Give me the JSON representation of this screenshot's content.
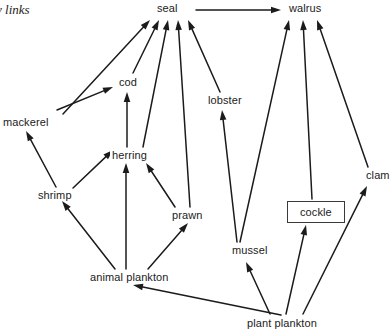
{
  "figure": {
    "caption": "y links",
    "width": 391,
    "height": 334,
    "background_color": "#ffffff",
    "line_color": "#1b1b1b",
    "text_color": "#1b1b1b"
  },
  "nodes": [
    {
      "id": "seal",
      "label": "seal",
      "x": 155,
      "y": 2,
      "boxed": false
    },
    {
      "id": "walrus",
      "label": "walrus",
      "x": 287,
      "y": 2,
      "boxed": false
    },
    {
      "id": "cod",
      "label": "cod",
      "x": 117,
      "y": 76,
      "boxed": false
    },
    {
      "id": "lobster",
      "label": "lobster",
      "x": 206,
      "y": 94,
      "boxed": false
    },
    {
      "id": "mackerel",
      "label": "mackerel",
      "x": 1,
      "y": 116,
      "boxed": false
    },
    {
      "id": "clam",
      "label": "clam",
      "x": 364,
      "y": 169,
      "boxed": false
    },
    {
      "id": "herring",
      "label": "herring",
      "x": 110,
      "y": 149,
      "boxed": false
    },
    {
      "id": "shrimp",
      "label": "shrimp",
      "x": 36,
      "y": 189,
      "boxed": false
    },
    {
      "id": "prawn",
      "label": "prawn",
      "x": 170,
      "y": 209,
      "boxed": false
    },
    {
      "id": "cockle",
      "label": "cockle",
      "x": 287,
      "y": 201,
      "boxed": true
    },
    {
      "id": "mussel",
      "label": "mussel",
      "x": 230,
      "y": 244,
      "boxed": false
    },
    {
      "id": "animal_plankton",
      "label": "animal plankton",
      "x": 88,
      "y": 271,
      "boxed": false
    },
    {
      "id": "plant_plankton",
      "label": "plant plankton",
      "x": 245,
      "y": 317,
      "boxed": false
    }
  ],
  "links": [
    {
      "id": "mackerel-to-seal",
      "from": "mackerel",
      "to": "seal",
      "x1": 63,
      "y1": 114,
      "x2": 150,
      "y2": 20
    },
    {
      "id": "cod-to-seal",
      "from": "cod",
      "to": "seal",
      "x1": 133,
      "y1": 73,
      "x2": 159,
      "y2": 20
    },
    {
      "id": "herring-to-seal",
      "from": "herring",
      "to": "seal",
      "x1": 143,
      "y1": 147,
      "x2": 168,
      "y2": 20
    },
    {
      "id": "prawn-to-seal",
      "from": "prawn",
      "to": "seal",
      "x1": 190,
      "y1": 207,
      "x2": 178,
      "y2": 20
    },
    {
      "id": "lobster-to-seal",
      "from": "lobster",
      "to": "seal",
      "x1": 220,
      "y1": 92,
      "x2": 188,
      "y2": 20
    },
    {
      "id": "seal-to-walrus",
      "from": "seal",
      "to": "walrus",
      "x1": 196,
      "y1": 10,
      "x2": 281,
      "y2": 10
    },
    {
      "id": "mussel-to-walrus",
      "from": "mussel",
      "to": "walrus",
      "x1": 240,
      "y1": 242,
      "x2": 289,
      "y2": 20
    },
    {
      "id": "cockle-to-walrus",
      "from": "cockle",
      "to": "walrus",
      "x1": 312,
      "y1": 199,
      "x2": 303,
      "y2": 20
    },
    {
      "id": "clam-to-walrus",
      "from": "clam",
      "to": "walrus",
      "x1": 368,
      "y1": 167,
      "x2": 317,
      "y2": 20
    },
    {
      "id": "mackerel-to-cod",
      "from": "mackerel",
      "to": "cod",
      "x1": 57,
      "y1": 110,
      "x2": 113,
      "y2": 87
    },
    {
      "id": "herring-to-cod",
      "from": "herring",
      "to": "cod",
      "x1": 127,
      "y1": 147,
      "x2": 127,
      "y2": 92
    },
    {
      "id": "mussel-to-lobster",
      "from": "mussel",
      "to": "lobster",
      "x1": 237,
      "y1": 242,
      "x2": 222,
      "y2": 110
    },
    {
      "id": "shrimp-to-mackerel",
      "from": "shrimp",
      "to": "mackerel",
      "x1": 56,
      "y1": 187,
      "x2": 26,
      "y2": 131
    },
    {
      "id": "shrimp-to-herring",
      "from": "shrimp",
      "to": "herring",
      "x1": 73,
      "y1": 188,
      "x2": 113,
      "y2": 150
    },
    {
      "id": "animal-plankton-to-herring",
      "from": "animal_plankton",
      "to": "herring",
      "x1": 126,
      "y1": 269,
      "x2": 126,
      "y2": 163
    },
    {
      "id": "prawn-to-herring",
      "from": "prawn",
      "to": "herring",
      "x1": 175,
      "y1": 207,
      "x2": 146,
      "y2": 163
    },
    {
      "id": "animal-plankton-to-shrimp",
      "from": "animal_plankton",
      "to": "shrimp",
      "x1": 115,
      "y1": 269,
      "x2": 62,
      "y2": 201
    },
    {
      "id": "animal-plankton-to-prawn",
      "from": "animal_plankton",
      "to": "prawn",
      "x1": 148,
      "y1": 269,
      "x2": 188,
      "y2": 223
    },
    {
      "id": "plant-plankton-to-animal",
      "from": "plant_plankton",
      "to": "animal_plankton",
      "x1": 281,
      "y1": 315,
      "x2": 133,
      "y2": 285
    },
    {
      "id": "plant-plankton-to-mussel",
      "from": "plant_plankton",
      "to": "mussel",
      "x1": 270,
      "y1": 314,
      "x2": 246,
      "y2": 262
    },
    {
      "id": "plant-plankton-to-cockle",
      "from": "plant_plankton",
      "to": "cockle",
      "x1": 286,
      "y1": 314,
      "x2": 306,
      "y2": 225
    },
    {
      "id": "plant-plankton-to-clam",
      "from": "plant_plankton",
      "to": "clam",
      "x1": 303,
      "y1": 314,
      "x2": 367,
      "y2": 186
    }
  ]
}
